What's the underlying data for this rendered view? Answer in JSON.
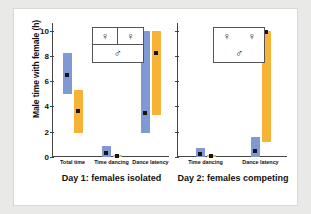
{
  "chart_data": {
    "type": "bar",
    "title": "",
    "ylabel": "Male time with female (h)",
    "xlabel": "",
    "ylim": [
      0,
      10.6
    ],
    "yticks": [
      0,
      2,
      4,
      6,
      8,
      10
    ],
    "ytick_labels": [
      "0",
      "2",
      "4",
      "6",
      "8",
      "10"
    ],
    "grid": false,
    "legend_position": "inside-top-center",
    "panels": [
      {
        "caption": "Day 1:  females isolated",
        "legend": {
          "females": [
            "female-symbol",
            "female-symbol"
          ],
          "male": "male-symbol",
          "divided": true
        },
        "categories": [
          "Total time",
          "Time dancing",
          "Dance latency"
        ],
        "series": [
          {
            "name": "blue",
            "color": "#7f99d4",
            "bars": [
              {
                "category": "Total time",
                "low": 4.95,
                "high": 8.2,
                "median": 6.5
              },
              {
                "category": "Time dancing",
                "low": 0.0,
                "high": 0.9,
                "median": 0.35
              },
              {
                "category": "Dance latency",
                "low": 1.9,
                "high": 10.0,
                "median": 3.5
              }
            ]
          },
          {
            "name": "orange",
            "color": "#f7b335",
            "bars": [
              {
                "category": "Total time",
                "low": 1.9,
                "high": 5.3,
                "median": 3.6
              },
              {
                "category": "Time dancing",
                "low": 0.0,
                "high": 0.18,
                "median": 0.05
              },
              {
                "category": "Dance latency",
                "low": 3.3,
                "high": 10.0,
                "median": 8.2
              }
            ]
          }
        ]
      },
      {
        "caption": "Day 2:  females competing",
        "legend": {
          "females": [
            "female-symbol",
            "female-symbol"
          ],
          "male": "male-symbol",
          "divided": false
        },
        "categories": [
          "Time dancing",
          "Dance latency"
        ],
        "series": [
          {
            "name": "blue",
            "color": "#7f99d4",
            "bars": [
              {
                "category": "Time dancing",
                "low": 0.0,
                "high": 0.7,
                "median": 0.25
              },
              {
                "category": "Dance latency",
                "low": 0.0,
                "high": 1.6,
                "median": 0.45
              }
            ]
          },
          {
            "name": "orange",
            "color": "#f7b335",
            "bars": [
              {
                "category": "Time dancing",
                "low": 0.0,
                "high": 0.16,
                "median": 0.05
              },
              {
                "category": "Dance latency",
                "low": 1.2,
                "high": 10.0,
                "median": 9.9
              }
            ]
          }
        ]
      }
    ],
    "symbols": {
      "female": "♀",
      "male": "♂"
    },
    "colors": {
      "blue": "#7f99d4",
      "orange": "#f7b335",
      "marker": "#141414",
      "axis": "#444444",
      "background": "#ffffff",
      "page_background": "#e9e9e7"
    }
  }
}
